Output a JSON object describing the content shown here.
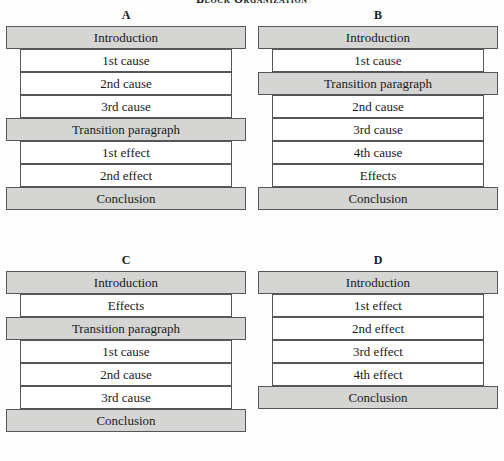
{
  "figure": {
    "title": "Block Organization",
    "colors": {
      "band_fill": "#d5d5d3",
      "row_fill": "#ffffff",
      "border": "#55565a",
      "background": "#fdfdfd",
      "text": "#1a1a1a"
    }
  },
  "diagrams": [
    {
      "label": "A",
      "rows": [
        {
          "text": "Introduction",
          "style": "band"
        },
        {
          "text": "1st cause",
          "style": "inset"
        },
        {
          "text": "2nd cause",
          "style": "inset"
        },
        {
          "text": "3rd cause",
          "style": "inset"
        },
        {
          "text": "Transition paragraph",
          "style": "band"
        },
        {
          "text": "1st effect",
          "style": "inset"
        },
        {
          "text": "2nd effect",
          "style": "inset"
        },
        {
          "text": "Conclusion",
          "style": "band"
        }
      ]
    },
    {
      "label": "B",
      "rows": [
        {
          "text": "Introduction",
          "style": "band"
        },
        {
          "text": "1st cause",
          "style": "inset"
        },
        {
          "text": "Transition paragraph",
          "style": "band"
        },
        {
          "text": "2nd cause",
          "style": "inset"
        },
        {
          "text": "3rd cause",
          "style": "inset"
        },
        {
          "text": "4th cause",
          "style": "inset"
        },
        {
          "text": "Effects",
          "style": "inset"
        },
        {
          "text": "Conclusion",
          "style": "band"
        }
      ]
    },
    {
      "label": "C",
      "rows": [
        {
          "text": "Introduction",
          "style": "band"
        },
        {
          "text": "Effects",
          "style": "inset"
        },
        {
          "text": "Transition paragraph",
          "style": "band"
        },
        {
          "text": "1st cause",
          "style": "inset"
        },
        {
          "text": "2nd cause",
          "style": "inset"
        },
        {
          "text": "3rd cause",
          "style": "inset"
        },
        {
          "text": "Conclusion",
          "style": "band"
        }
      ]
    },
    {
      "label": "D",
      "rows": [
        {
          "text": "Introduction",
          "style": "band"
        },
        {
          "text": "1st effect",
          "style": "inset"
        },
        {
          "text": "2nd effect",
          "style": "inset"
        },
        {
          "text": "3rd effect",
          "style": "inset"
        },
        {
          "text": "4th effect",
          "style": "inset"
        },
        {
          "text": "Conclusion",
          "style": "band"
        }
      ]
    }
  ]
}
